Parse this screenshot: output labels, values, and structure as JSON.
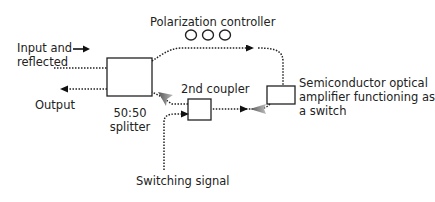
{
  "diagram": {
    "type": "optical switching setup",
    "labels": {
      "input_line1": "Input and",
      "input_line2": "reflected",
      "output": "Output",
      "splitter_line1": "50:50",
      "splitter_line2": "splitter",
      "polarization_controller": "Polarization controller",
      "second_coupler": "2nd coupler",
      "soa_line1": "Semiconductor optical",
      "soa_line2": "amplifier functioning as",
      "soa_line3": "a switch",
      "switching_signal": "Switching signal"
    },
    "components": [
      {
        "id": "splitter",
        "name": "50:50 splitter"
      },
      {
        "id": "polarization-controller",
        "name": "Polarization controller",
        "loops": 3
      },
      {
        "id": "second-coupler",
        "name": "2nd coupler"
      },
      {
        "id": "soa",
        "name": "Semiconductor optical amplifier functioning as a switch"
      }
    ],
    "connections": [
      {
        "from": "input",
        "to": "splitter",
        "style": "dotted"
      },
      {
        "from": "splitter",
        "to": "output",
        "style": "dotted",
        "arrow": "left"
      },
      {
        "from": "splitter",
        "to": "soa",
        "via": "polarization-controller",
        "style": "dotted",
        "arrow": "right"
      },
      {
        "from": "soa",
        "to": "second-coupler",
        "style": "dotted",
        "arrow": "left"
      },
      {
        "from": "second-coupler",
        "to": "splitter",
        "style": "dotted",
        "arrow": "up-left"
      },
      {
        "from": "switching-signal",
        "to": "second-coupler",
        "style": "dotted",
        "arrow": "right"
      }
    ],
    "colors": {
      "line": "#222222",
      "gray_arrow": "#8a8a8a",
      "background": "#ffffff"
    }
  }
}
